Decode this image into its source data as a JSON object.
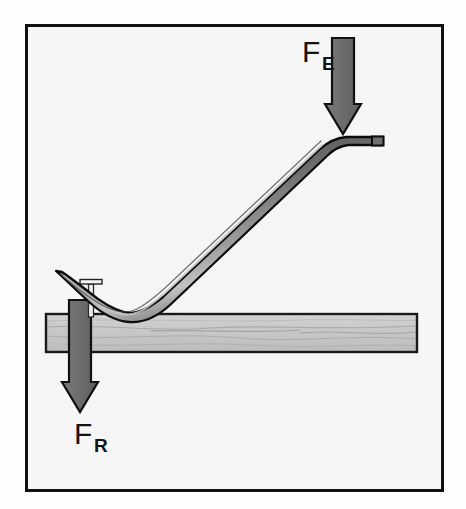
{
  "figure": {
    "background_color": "#fdfdfd",
    "frame": {
      "name": "illustration-border",
      "x": 25,
      "y": 24,
      "width": 419,
      "height": 468,
      "stroke_color": "#111111",
      "stroke_width": 3,
      "fill_color": "#f6f6f6"
    },
    "labels": {
      "effort": {
        "base": "F",
        "subscript": "E",
        "full": "FE",
        "meaning": "effort force",
        "x": 302,
        "y": 62,
        "color": "#141414"
      },
      "resistance": {
        "base": "F",
        "subscript": "R",
        "full": "FR",
        "meaning": "resistance force",
        "x": 74,
        "y": 444,
        "color": "#141414"
      }
    },
    "arrows": {
      "effort_arrow": {
        "name": "effort-force-arrow",
        "direction": "down",
        "color": "#6d6d6d",
        "outline_color": "#111111",
        "shaft_x": 343,
        "shaft_top": 38,
        "shaft_width": 22,
        "head_width": 36,
        "tip_y": 134
      },
      "resistance_arrow": {
        "name": "resistance-force-arrow",
        "direction": "down",
        "color": "#6d6d6d",
        "outline_color": "#111111",
        "shaft_x": 80,
        "shaft_top": 300,
        "shaft_width": 22,
        "head_width": 36,
        "tip_y": 412
      }
    },
    "board": {
      "name": "wooden-board",
      "x": 45,
      "y": 313,
      "width": 373,
      "height": 40,
      "fill_color": "#c9c9c9",
      "stroke_color": "#1a1a1a",
      "grain_color": "#9a9a9a",
      "material": "wood"
    },
    "crowbar": {
      "name": "crowbar-lever",
      "body_color": "#5a5a5a",
      "highlight_color": "#b4b4b4",
      "outline_color": "#0d0d0d",
      "hook_tip": {
        "x": 62,
        "y": 273
      },
      "fulcrum": {
        "x": 122,
        "y": 313
      },
      "handle_tip": {
        "x": 383,
        "y": 140
      }
    },
    "nail": {
      "name": "nail",
      "head_y": 281,
      "head_width": 22,
      "shaft_x": 92,
      "shaft_bottom": 316,
      "fill_color": "#efefef",
      "outline_color": "#2a2a2a"
    }
  }
}
